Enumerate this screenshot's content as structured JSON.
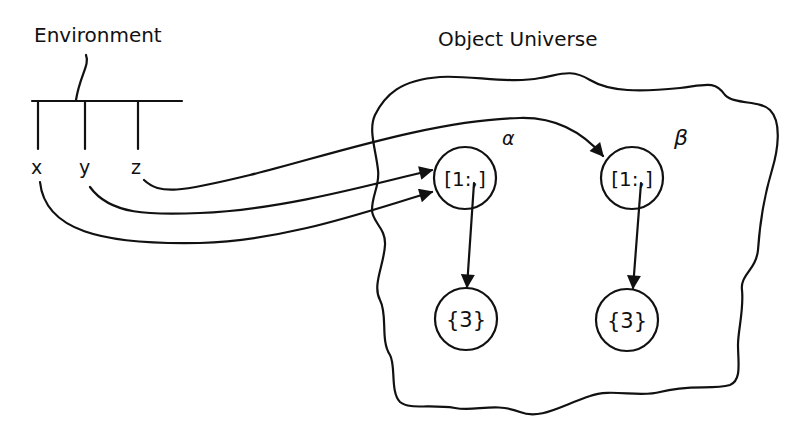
{
  "environment": {
    "title": "Environment",
    "variables": [
      "x",
      "y",
      "z"
    ]
  },
  "universe": {
    "title": "Object Universe",
    "objects": [
      {
        "id": "alpha",
        "label": "α",
        "content": "[1:,]",
        "child": "{3}"
      },
      {
        "id": "beta",
        "label": "β",
        "content": "[1:,]",
        "child": "{3}"
      }
    ]
  },
  "bindings": [
    {
      "from": "x",
      "to": "α"
    },
    {
      "from": "y",
      "to": "α"
    },
    {
      "from": "z",
      "to": "β"
    }
  ]
}
